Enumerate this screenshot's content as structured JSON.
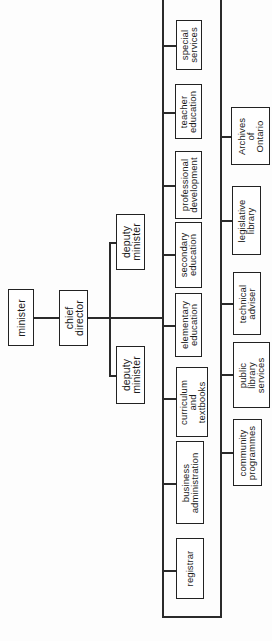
{
  "diagram": {
    "type": "organization-chart",
    "orientation": "rotated-90-counterclockwise",
    "colors": {
      "line": "#2a2a2a",
      "box_border": "#222222",
      "text": "#1a1a1a",
      "background": "#ffffff"
    },
    "top": {
      "minister": "minister",
      "chief_director": "chief\ndirector"
    },
    "deputies": [
      {
        "label": "deputy\nminister"
      },
      {
        "label": "deputy\nminister"
      }
    ],
    "branches": [
      {
        "label": "special\nservices"
      },
      {
        "label": "teacher\neducation"
      },
      {
        "label": "professional\ndevelopment"
      },
      {
        "label": "secondary\neducation"
      },
      {
        "label": "elementary\neducation"
      },
      {
        "label": "curriculum\nand\ntextbooks"
      },
      {
        "label": "business\nadministration"
      },
      {
        "label": "registrar"
      }
    ],
    "sub_branches": [
      {
        "label": "Archives\nof\nOntario"
      },
      {
        "label": "legislative\nlibrary"
      },
      {
        "label": "technical\nadviser"
      },
      {
        "label": "public\nlibrary\nservices"
      },
      {
        "label": "community\nprogrammes"
      }
    ]
  }
}
